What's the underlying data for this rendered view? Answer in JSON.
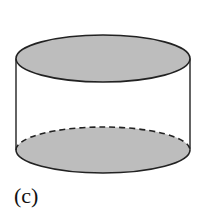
{
  "figure": {
    "label": "(c)",
    "shape": "cylinder",
    "colors": {
      "fill": "#bdbdbd",
      "stroke": "#222222",
      "background": "#ffffff"
    },
    "top_ellipse": {
      "cx": 103,
      "cy": 58.5,
      "rx": 87,
      "ry": 23.5
    },
    "bottom_ellipse": {
      "cx": 103,
      "cy": 150,
      "rx": 87,
      "ry": 23,
      "back_edge": "dashed"
    },
    "sides": {
      "left_x": 16,
      "right_x": 190
    }
  }
}
